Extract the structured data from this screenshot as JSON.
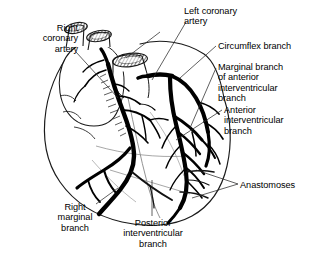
{
  "figure": {
    "colors": {
      "background": "#ffffff",
      "outline": "#1a1a1a",
      "artery": "#000000",
      "leader_line": "#2b2b2b"
    }
  },
  "labels": {
    "right_coronary_artery": "Right\ncoronary\nartery",
    "left_coronary_artery": "Left coronary\nartery",
    "circumflex_branch": "Circumflex branch",
    "marginal_branch_of_anterior_interventricular_branch": "Marginal branch\nof anterior\ninterventricular\nbranch",
    "anterior_interventricular_branch": "Anterior\ninterventricular\nbranch",
    "anastomoses": "Anastomoses",
    "right_marginal_branch": "Right\nmarginal\nbranch",
    "posterior_interventricular_branch": "Posterior\ninterventricular\nbranch"
  }
}
